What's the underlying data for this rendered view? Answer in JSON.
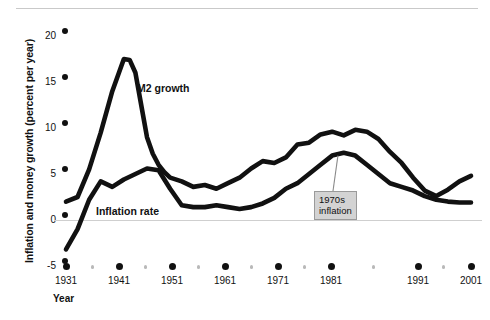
{
  "chart_data": {
    "type": "line",
    "title": "",
    "xlabel": "Year",
    "ylabel": "Inflation and money growth (percent per year)",
    "xlim": [
      1931,
      2001
    ],
    "ylim": [
      -5,
      20
    ],
    "xticks": [
      1931,
      1941,
      1951,
      1961,
      1971,
      1981,
      1991,
      2001
    ],
    "xtick_labels": [
      "1931",
      "1941",
      "1951",
      "1961",
      "1971",
      "1981",
      "1991",
      "2001"
    ],
    "xticks_minor": [
      1936,
      1946,
      1956,
      1966,
      1976,
      1986,
      1996
    ],
    "yticks": [
      20,
      15,
      10,
      5,
      0,
      -5
    ],
    "ytick_labels": [
      "20",
      "15",
      "10",
      "5",
      "0",
      "-5"
    ],
    "grid": false,
    "legend_position": "inline-labels",
    "zero_line": true,
    "line_color": "#111111",
    "series": [
      {
        "name": "M2 growth",
        "label_x": 1952,
        "label_y": 13.2,
        "x": [
          1931,
          1933,
          1935,
          1937,
          1939,
          1941,
          1942,
          1943,
          1944,
          1945,
          1946,
          1947,
          1948,
          1949,
          1951,
          1953,
          1955,
          1957,
          1959,
          1961,
          1963,
          1965,
          1967,
          1969,
          1971,
          1973,
          1975,
          1977,
          1979,
          1981,
          1983,
          1985,
          1987,
          1989,
          1991,
          1993,
          1995,
          1997,
          1999,
          2001
        ],
        "y": [
          2.0,
          2.5,
          5.5,
          9.5,
          14.0,
          17.5,
          17.4,
          16.0,
          12.5,
          9.0,
          7.2,
          6.0,
          5.2,
          4.6,
          4.2,
          3.6,
          3.8,
          3.4,
          4.0,
          4.6,
          5.6,
          6.4,
          6.2,
          6.8,
          8.2,
          8.4,
          9.3,
          9.6,
          9.2,
          9.8,
          9.6,
          8.8,
          7.4,
          6.2,
          4.6,
          3.2,
          2.6,
          3.3,
          4.2,
          4.8
        ],
        "peak": {
          "year": 1941,
          "value": 17.5
        }
      },
      {
        "name": "Inflation rate",
        "label_x": 1938,
        "label_y": 0.9,
        "x": [
          1931,
          1933,
          1935,
          1937,
          1939,
          1941,
          1943,
          1945,
          1947,
          1949,
          1951,
          1953,
          1955,
          1957,
          1959,
          1961,
          1963,
          1965,
          1967,
          1969,
          1971,
          1973,
          1975,
          1977,
          1979,
          1981,
          1983,
          1985,
          1987,
          1989,
          1991,
          1993,
          1995,
          1997,
          1999,
          2001
        ],
        "y": [
          -3.2,
          -1.0,
          2.2,
          4.2,
          3.6,
          4.4,
          5.0,
          5.6,
          5.4,
          3.4,
          1.6,
          1.4,
          1.4,
          1.6,
          1.4,
          1.2,
          1.4,
          1.8,
          2.4,
          3.4,
          4.0,
          5.0,
          6.0,
          7.0,
          7.3,
          7.0,
          6.0,
          5.0,
          4.0,
          3.6,
          3.2,
          2.6,
          2.2,
          2.0,
          1.9,
          1.9
        ],
        "peak": {
          "year": 1979,
          "value": 7.3
        }
      }
    ],
    "annotations": [
      {
        "id": "seventies-inflation",
        "text_line1": "1970s",
        "text_line2": "inflation",
        "points_to_year": 1978,
        "points_to_value": 7.0
      }
    ]
  }
}
